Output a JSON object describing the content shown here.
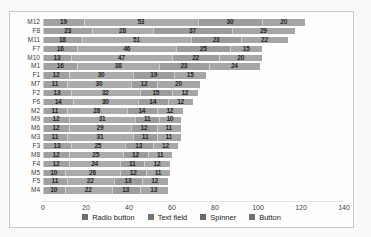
{
  "chart_data": {
    "type": "bar",
    "orientation": "horizontal",
    "stacked": true,
    "title": "",
    "xlabel": "",
    "ylabel": "",
    "grid": false,
    "legend_position": "bottom",
    "xlim": [
      0,
      140
    ],
    "x_ticks": [
      0,
      20,
      40,
      60,
      80,
      100,
      120,
      140
    ],
    "categories": [
      "M12",
      "F8",
      "M11",
      "F7",
      "M10",
      "M1",
      "F1",
      "M7",
      "F2",
      "F6",
      "M2",
      "M9",
      "M6",
      "M3",
      "F3",
      "M8",
      "F4",
      "M5",
      "F5",
      "M4"
    ],
    "series": [
      {
        "name": "Radio button",
        "color": "#a1a1a1",
        "values": [
          19,
          23,
          18,
          16,
          13,
          16,
          12,
          11,
          13,
          14,
          11,
          12,
          12,
          11,
          13,
          12,
          12,
          10,
          11,
          10
        ]
      },
      {
        "name": "Text field",
        "color": "#ababab",
        "values": [
          53,
          28,
          51,
          46,
          47,
          38,
          30,
          30,
          32,
          30,
          28,
          31,
          29,
          31,
          25,
          25,
          24,
          26,
          22,
          22
        ]
      },
      {
        "name": "Spinner",
        "color": "#9c9c9c",
        "values": [
          30,
          37,
          23,
          25,
          22,
          23,
          19,
          12,
          15,
          14,
          14,
          11,
          12,
          11,
          13,
          12,
          11,
          12,
          13,
          13
        ]
      },
      {
        "name": "Button",
        "color": "#a6a6a6",
        "values": [
          20,
          29,
          22,
          15,
          20,
          24,
          15,
          20,
          12,
          12,
          12,
          10,
          11,
          11,
          12,
          11,
          12,
          11,
          12,
          13
        ]
      }
    ]
  },
  "style": {
    "frame_border": "#c9c9c9",
    "frame_background": "#fefefe",
    "segment_label_color": "#262626",
    "axis_label_color": "#404040"
  }
}
